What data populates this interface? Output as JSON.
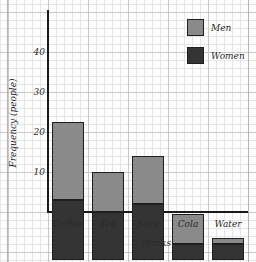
{
  "chart_data": {
    "type": "bar",
    "subtype": "stacked",
    "title": "",
    "xlabel": "Drinks",
    "ylabel": "Frequency (people)",
    "categories": [
      "Coffee",
      "Tea",
      "Juice",
      "Cola",
      "Water"
    ],
    "series": [
      {
        "name": "Women",
        "color": "#343434",
        "values": [
          15,
          12,
          14,
          4,
          4
        ]
      },
      {
        "name": "Men",
        "color": "#8a8a8a",
        "values": [
          19.5,
          10,
          12,
          7.5,
          1.5
        ]
      }
    ],
    "totals": [
      34.5,
      22,
      26,
      11.5,
      5.5
    ],
    "ylim": [
      0,
      45
    ],
    "yticks": [
      10,
      20,
      30,
      40
    ],
    "grid": true,
    "legend_position": "top-right"
  },
  "axes": {
    "y_title": "Frequency (people)",
    "x_title": "Drinks",
    "y_ticks": [
      {
        "label": "40",
        "value": 40
      },
      {
        "label": "30",
        "value": 30
      },
      {
        "label": "20",
        "value": 20
      },
      {
        "label": "10",
        "value": 10
      }
    ],
    "x_categories": [
      {
        "label": "Coffee"
      },
      {
        "label": "Tea"
      },
      {
        "label": "Juice"
      },
      {
        "label": "Cola"
      },
      {
        "label": "Water"
      }
    ]
  },
  "legend": {
    "entries": [
      {
        "label": "Men",
        "color": "#8a8a8a"
      },
      {
        "label": "Women",
        "color": "#343434"
      }
    ]
  },
  "colors": {
    "men": "#8a8a8a",
    "women": "#343434",
    "axis": "#1a1a1a",
    "grid_major": "#c9c9c9",
    "grid_minor": "#e6e6e6",
    "paper": "#fdfdfd"
  }
}
